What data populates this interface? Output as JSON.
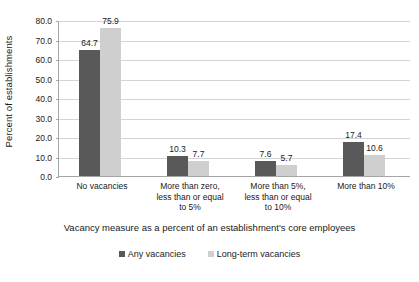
{
  "chart_data": {
    "type": "bar",
    "title": "",
    "subtitle": "",
    "xlabel": "Vacancy measure as a percent of an establishment's core employees",
    "ylabel": "Percent of establishments",
    "ylim": [
      0,
      80
    ],
    "ytick_step": 10,
    "ytick_labels": [
      "80.0",
      "70.0",
      "60.0",
      "50.0",
      "40.0",
      "30.0",
      "20.0",
      "10.0",
      "0.0"
    ],
    "ytick_values": [
      80,
      70,
      60,
      50,
      40,
      30,
      20,
      10,
      0
    ],
    "grid": true,
    "grid_axis": "y",
    "legend_position": "bottom",
    "categories": [
      "No vacancies",
      "More than zero,\nless than or equal\nto 5%",
      "More than 5%,\nless than or equal\nto 10%",
      "More than 10%"
    ],
    "series": [
      {
        "name": "Any vacancies",
        "color": "#595959",
        "values": [
          64.7,
          10.3,
          7.6,
          17.4
        ],
        "labels": [
          "64.7",
          "10.3",
          "7.6",
          "17.4"
        ]
      },
      {
        "name": "Long-term vacancies",
        "color": "#cfcfcf",
        "values": [
          75.9,
          7.7,
          5.7,
          10.6
        ],
        "labels": [
          "75.9",
          "7.7",
          "5.7",
          "10.6"
        ]
      }
    ]
  },
  "colors": {
    "any_vacancies": "#595959",
    "long_term_vacancies": "#cfcfcf",
    "gridline": "#d4d4d4",
    "axis": "#a6a6a6",
    "text": "#1a1a1a",
    "background": "#ffffff"
  }
}
